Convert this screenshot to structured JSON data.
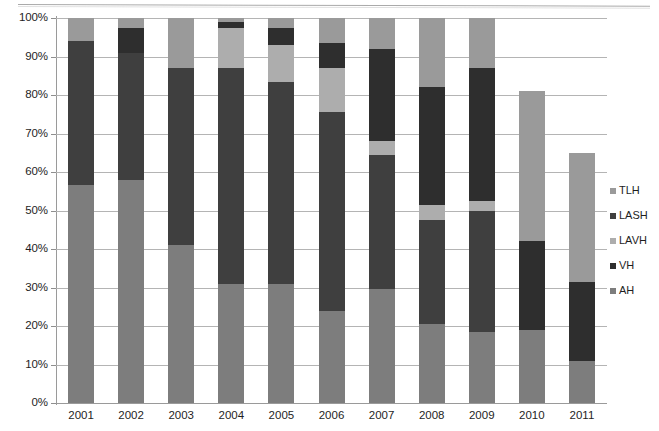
{
  "chart_data": {
    "type": "bar",
    "subtype": "stacked-percentage",
    "title": "",
    "xlabel": "",
    "ylabel": "",
    "ylim": [
      0,
      100
    ],
    "ytick_labels": [
      "0%",
      "10%",
      "20%",
      "30%",
      "40%",
      "50%",
      "60%",
      "70%",
      "80%",
      "90%",
      "100%"
    ],
    "ytick_values": [
      0,
      10,
      20,
      30,
      40,
      50,
      60,
      70,
      80,
      90,
      100
    ],
    "grid": "horizontal",
    "legend_position": "right",
    "categories": [
      "2001",
      "2002",
      "2003",
      "2004",
      "2005",
      "2006",
      "2007",
      "2008",
      "2009",
      "2010",
      "2011"
    ],
    "stack_order_bottom_to_top": [
      "AH",
      "LASH",
      "LAVH",
      "VH",
      "TLH"
    ],
    "series": [
      {
        "name": "AH",
        "color": "#7d7d7d",
        "values": [
          56.5,
          58.0,
          41.0,
          31.0,
          31.0,
          24.0,
          29.5,
          20.5,
          18.5,
          19.0,
          11.0
        ]
      },
      {
        "name": "LASH",
        "color": "#3f3f3f",
        "values": [
          37.5,
          33.0,
          46.0,
          56.0,
          52.5,
          51.5,
          35.0,
          27.0,
          31.5,
          0.0,
          0.0
        ]
      },
      {
        "name": "LAVH",
        "color": "#adadad",
        "values": [
          0.0,
          0.0,
          0.0,
          10.5,
          9.5,
          11.5,
          3.5,
          4.0,
          2.5,
          0.0,
          0.0
        ]
      },
      {
        "name": "VH",
        "color": "#2e2e2e",
        "values": [
          0.0,
          6.5,
          0.0,
          1.5,
          4.5,
          6.5,
          24.0,
          30.5,
          34.5,
          23.0,
          20.5
        ]
      },
      {
        "name": "TLH",
        "color": "#9a9a9a",
        "values": [
          6.0,
          2.5,
          13.0,
          1.0,
          2.5,
          6.5,
          8.0,
          18.0,
          13.0,
          39.0,
          33.5
        ]
      }
    ],
    "series_tops_cumulative": {
      "2001": {
        "AH": 56.5,
        "LASH": 94.0,
        "LAVH": 94.0,
        "VH": 94.0,
        "TLH": 100.0
      },
      "2002": {
        "AH": 58.0,
        "LASH": 91.0,
        "LAVH": 91.0,
        "VH": 97.5,
        "TLH": 100.0
      },
      "2003": {
        "AH": 41.0,
        "LASH": 87.0,
        "LAVH": 87.0,
        "VH": 87.0,
        "TLH": 100.0
      },
      "2004": {
        "AH": 31.0,
        "LASH": 87.0,
        "LAVH": 97.5,
        "VH": 99.0,
        "TLH": 100.0
      },
      "2005": {
        "AH": 31.0,
        "LASH": 83.5,
        "LAVH": 93.0,
        "VH": 97.5,
        "TLH": 100.0
      },
      "2006": {
        "AH": 24.0,
        "LASH": 75.5,
        "LAVH": 87.0,
        "VH": 93.5,
        "TLH": 100.0
      },
      "2007": {
        "AH": 29.5,
        "LASH": 64.5,
        "LAVH": 68.0,
        "VH": 92.0,
        "TLH": 100.0
      },
      "2008": {
        "AH": 20.5,
        "LASH": 47.5,
        "LAVH": 51.5,
        "VH": 82.0,
        "TLH": 100.0
      },
      "2009": {
        "AH": 18.5,
        "LASH": 50.0,
        "LAVH": 52.5,
        "VH": 87.0,
        "TLH": 100.0
      },
      "2010": {
        "AH": 19.0,
        "LASH": 19.0,
        "LAVH": 19.0,
        "VH": 42.0,
        "TLH": 100.0
      },
      "2011": {
        "AH": 11.0,
        "LASH": 11.0,
        "LAVH": 11.0,
        "VH": 31.5,
        "TLH": 100.0
      }
    },
    "legend_entries_top_to_bottom": [
      {
        "label": "TLH",
        "color": "#9a9a9a"
      },
      {
        "label": "LASH",
        "color": "#3f3f3f"
      },
      {
        "label": "LAVH",
        "color": "#adadad"
      },
      {
        "label": "VH",
        "color": "#2e2e2e"
      },
      {
        "label": "AH",
        "color": "#7d7d7d"
      }
    ]
  },
  "colors": {
    "gridline": "#b4b4b4",
    "axis": "#9a9a9a",
    "text": "#1e1e1e",
    "background": "#ffffff"
  }
}
